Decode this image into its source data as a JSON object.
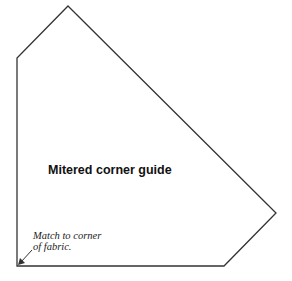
{
  "diagram": {
    "title": "Mitered corner guide",
    "note_lines": [
      "Match to corner",
      "of fabric."
    ],
    "outline_points": [
      [
        68,
        6
      ],
      [
        276,
        213
      ],
      [
        224,
        266
      ],
      [
        17,
        266
      ],
      [
        17,
        58
      ]
    ],
    "arrow": {
      "from": [
        32,
        250
      ],
      "to": [
        19,
        264
      ]
    },
    "stroke_color": "#333333"
  }
}
